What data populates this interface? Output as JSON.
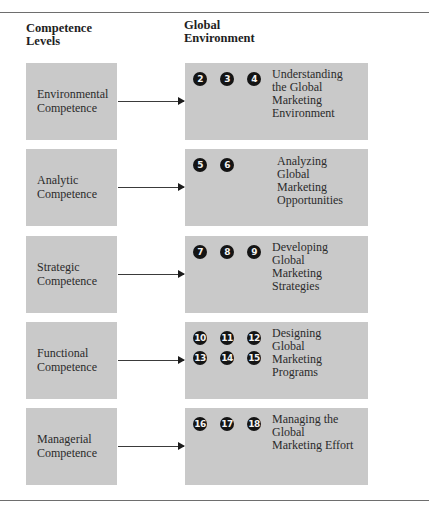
{
  "headers": {
    "left": [
      "Competence",
      "Levels"
    ],
    "right": [
      "Global",
      "Environment"
    ]
  },
  "rows": [
    {
      "level": [
        "Environmental",
        "Competence"
      ],
      "chapters": [
        "2",
        "3",
        "4"
      ],
      "description": [
        "Understanding",
        "the Global",
        "Marketing",
        "Environment"
      ]
    },
    {
      "level": [
        "Analytic",
        "Competence"
      ],
      "chapters": [
        "5",
        "6"
      ],
      "description": [
        "Analyzing",
        "Global",
        "Marketing",
        "Opportunities"
      ]
    },
    {
      "level": [
        "Strategic",
        "Competence"
      ],
      "chapters": [
        "7",
        "8",
        "9"
      ],
      "description": [
        "Developing",
        "Global",
        "Marketing",
        "Strategies"
      ]
    },
    {
      "level": [
        "Functional",
        "Competence"
      ],
      "chapters": [
        "10",
        "11",
        "12",
        "13",
        "14",
        "15"
      ],
      "description": [
        "Designing",
        "Global",
        "Marketing",
        "Programs"
      ]
    },
    {
      "level": [
        "Managerial",
        "Competence"
      ],
      "chapters": [
        "16",
        "17",
        "18"
      ],
      "description": [
        "Managing the",
        "Global",
        "Marketing Effort"
      ]
    }
  ],
  "colors": {
    "box_fill": "#c9c9c9",
    "chapter_circle": "#141414",
    "rule": "#6e6e6e"
  }
}
